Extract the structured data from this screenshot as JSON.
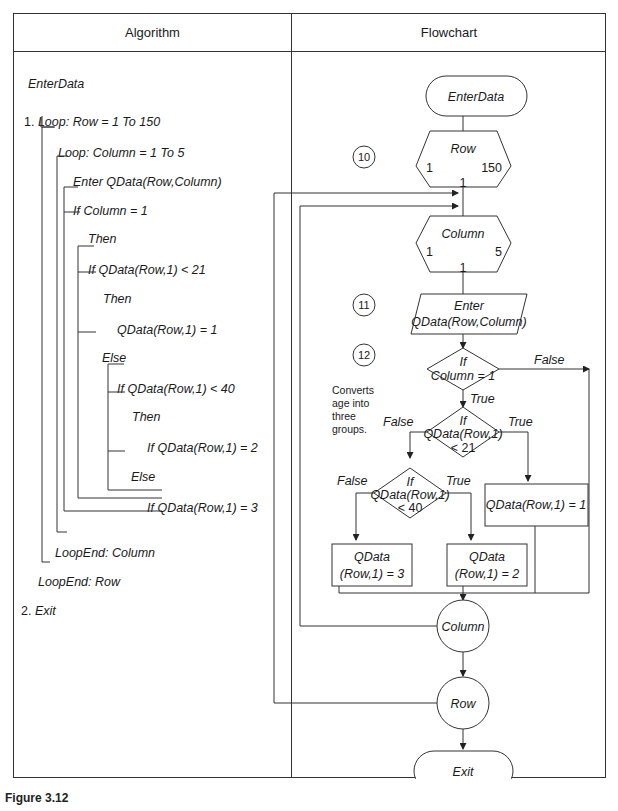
{
  "table": {
    "headers": {
      "algorithm": "Algorithm",
      "flowchart": "Flowchart"
    }
  },
  "algorithm": {
    "title": "EnterData",
    "lines": [
      {
        "num": "1.",
        "text": "Loop: Row = 1 To 150"
      },
      {
        "text": "Loop: Column = 1 To 5"
      },
      {
        "text": "Enter QData(Row,Column)"
      },
      {
        "text": "If Column = 1"
      },
      {
        "text": "Then"
      },
      {
        "text": "If QData(Row,1) < 21"
      },
      {
        "text": "Then"
      },
      {
        "text": "QData(Row,1) = 1"
      },
      {
        "text": "Else"
      },
      {
        "text": "If QData(Row,1) < 40"
      },
      {
        "text": "Then"
      },
      {
        "text": "If QData(Row,1) = 2"
      },
      {
        "text": "Else"
      },
      {
        "text": "If QData(Row,1) = 3"
      },
      {
        "text": "LoopEnd: Column"
      },
      {
        "text": "LoopEnd: Row"
      },
      {
        "num": "2.",
        "text": "Exit"
      }
    ]
  },
  "flowchart": {
    "start": "EnterData",
    "row_loop": {
      "label": "Row",
      "start": "1",
      "end": "150",
      "step": "1"
    },
    "col_loop": {
      "label": "Column",
      "start": "1",
      "end": "5",
      "step": "1"
    },
    "input": {
      "line1": "Enter",
      "line2": "QData(Row,Column)"
    },
    "decision1": {
      "line1": "If",
      "line2": "Column = 1",
      "true_label": "True",
      "false_label": "False"
    },
    "decision2": {
      "line1": "If",
      "line2": "QData(Row,1)",
      "line3": "< 21",
      "true_label": "True",
      "false_label": "False"
    },
    "decision3": {
      "line1": "If",
      "line2": "QData(Row,1)",
      "line3": "< 40",
      "true_label": "True",
      "false_label": "False"
    },
    "process1": "QData(Row,1) = 1",
    "process2": {
      "line1": "QData",
      "line2": "(Row,1) = 2"
    },
    "process3": {
      "line1": "QData",
      "line2": "(Row,1) = 3"
    },
    "col_end": "Column",
    "row_end": "Row",
    "end": "Exit",
    "markers": [
      "10",
      "11",
      "12"
    ],
    "note": [
      "Converts",
      "age into",
      "three",
      "groups."
    ]
  },
  "caption": "Figure 3.12"
}
